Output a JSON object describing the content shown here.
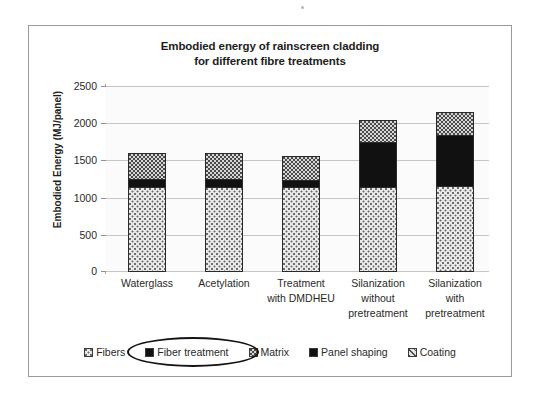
{
  "chart_data": {
    "type": "bar",
    "subtype": "stacked-column",
    "title": "Embodied energy of rainscreen cladding for different fibre treatments",
    "title_lines": [
      "Embodied energy of rainscreen cladding",
      "for different fibre treatments"
    ],
    "xlabel": "",
    "ylabel": "Embodied Energy (MJ/panel)",
    "ylim": [
      0,
      2500
    ],
    "ytick_labels": [
      "2500",
      "2000",
      "1500",
      "1000",
      "500",
      "0"
    ],
    "ytick_values": [
      2500,
      2000,
      1500,
      1000,
      500,
      0
    ],
    "grid": true,
    "legend_position": "bottom",
    "categories": [
      "Waterglass",
      "Acetylation",
      "Treatment with DMDHEU",
      "Silanization without pretreatment",
      "Silanization with pretreatment"
    ],
    "category_label_lines": [
      [
        "Waterglass"
      ],
      [
        "Acetylation"
      ],
      [
        "Treatment",
        "with DMDHEU"
      ],
      [
        "Silanization",
        "without",
        "pretreatment"
      ],
      [
        "Silanization",
        "with",
        "pretreatment"
      ]
    ],
    "series": [
      {
        "name": "Fibers",
        "values": [
          1130,
          1130,
          1130,
          1135,
          1140
        ]
      },
      {
        "name": "Fiber treatment",
        "values": [
          110,
          110,
          100,
          610,
          700
        ]
      },
      {
        "name": "Matrix",
        "values": [
          355,
          355,
          330,
          295,
          310
        ]
      },
      {
        "name": "Panel shaping",
        "values": [
          0,
          0,
          0,
          0,
          0
        ]
      },
      {
        "name": "Coating",
        "values": [
          0,
          0,
          0,
          0,
          0
        ]
      }
    ],
    "totals": [
      1595,
      1595,
      1560,
      2040,
      2150
    ],
    "annotation": {
      "type": "ellipse",
      "target": "Fiber treatment",
      "note": "hand-drawn oval highlighting the Fiber treatment legend entry"
    }
  },
  "legend": {
    "items": [
      {
        "label": "Fibers",
        "pattern": "checker-dot",
        "highlighted": false
      },
      {
        "label": "Fiber treatment",
        "pattern": "solid-black",
        "highlighted": true
      },
      {
        "label": "Matrix",
        "pattern": "coarse-dot",
        "highlighted": false
      },
      {
        "label": "Panel shaping",
        "pattern": "solid-black",
        "highlighted": false
      },
      {
        "label": "Coating",
        "pattern": "diagonal-line",
        "highlighted": false
      }
    ]
  },
  "colors": {
    "frame": "#9a9a9a",
    "gridline": "#c6c6c6",
    "plot_background": "#fbfbfb",
    "bar_outline": "#2a2a2a",
    "fibers": "#e9e9e9",
    "fiber_treatment": "#111111",
    "matrix": "#d6d6d6",
    "coating": "#e2e2e2",
    "text": "#2a2a2a",
    "annotation": "#141414"
  }
}
